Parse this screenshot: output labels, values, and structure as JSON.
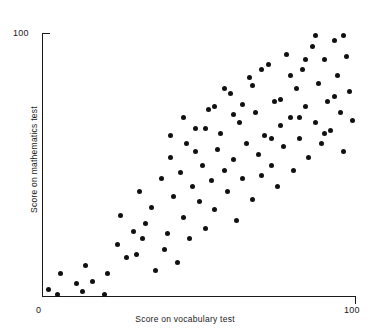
{
  "chart_data": {
    "type": "scatter",
    "title": "",
    "xlabel": "Score on vocabulary test",
    "ylabel": "Score on mathematics test",
    "xlim": [
      0,
      100
    ],
    "ylim": [
      0,
      100
    ],
    "xticks": [
      0,
      100
    ],
    "yticks": [
      100
    ],
    "xtick_labels": [
      "0",
      "100"
    ],
    "ytick_labels": [
      "100"
    ],
    "grid": false,
    "legend": null,
    "marker": "filled-circle",
    "marker_color": "#111111",
    "marker_size_px": 5,
    "axis_color": "#1a1a1a",
    "background_color": "#ffffff",
    "n_points": 100,
    "points": [
      [
        2,
        3
      ],
      [
        5,
        1
      ],
      [
        6,
        9
      ],
      [
        11,
        5
      ],
      [
        13,
        2
      ],
      [
        14,
        12
      ],
      [
        16,
        6
      ],
      [
        20,
        1
      ],
      [
        21,
        9
      ],
      [
        24,
        20
      ],
      [
        25,
        31
      ],
      [
        27,
        15
      ],
      [
        29,
        25
      ],
      [
        30,
        16
      ],
      [
        31,
        40
      ],
      [
        32,
        22
      ],
      [
        33,
        28
      ],
      [
        35,
        34
      ],
      [
        36,
        10
      ],
      [
        38,
        45
      ],
      [
        39,
        18
      ],
      [
        40,
        24
      ],
      [
        41,
        53
      ],
      [
        42,
        38
      ],
      [
        43,
        13
      ],
      [
        44,
        47
      ],
      [
        45,
        30
      ],
      [
        46,
        58
      ],
      [
        47,
        22
      ],
      [
        48,
        42
      ],
      [
        49,
        64
      ],
      [
        50,
        36
      ],
      [
        51,
        50
      ],
      [
        52,
        26
      ],
      [
        53,
        71
      ],
      [
        54,
        44
      ],
      [
        55,
        33
      ],
      [
        56,
        56
      ],
      [
        57,
        62
      ],
      [
        58,
        48
      ],
      [
        59,
        40
      ],
      [
        60,
        77
      ],
      [
        61,
        52
      ],
      [
        62,
        29
      ],
      [
        63,
        66
      ],
      [
        64,
        45
      ],
      [
        65,
        58
      ],
      [
        66,
        83
      ],
      [
        67,
        37
      ],
      [
        68,
        70
      ],
      [
        69,
        54
      ],
      [
        70,
        46
      ],
      [
        71,
        61
      ],
      [
        72,
        88
      ],
      [
        73,
        50
      ],
      [
        74,
        74
      ],
      [
        75,
        42
      ],
      [
        76,
        65
      ],
      [
        77,
        57
      ],
      [
        78,
        92
      ],
      [
        79,
        68
      ],
      [
        80,
        48
      ],
      [
        81,
        79
      ],
      [
        82,
        60
      ],
      [
        83,
        86
      ],
      [
        84,
        72
      ],
      [
        85,
        53
      ],
      [
        86,
        95
      ],
      [
        87,
        66
      ],
      [
        88,
        81
      ],
      [
        89,
        58
      ],
      [
        90,
        90
      ],
      [
        91,
        74
      ],
      [
        92,
        63
      ],
      [
        93,
        97
      ],
      [
        94,
        84
      ],
      [
        95,
        70
      ],
      [
        96,
        55
      ],
      [
        97,
        91
      ],
      [
        98,
        78
      ],
      [
        99,
        67
      ],
      [
        96,
        99
      ],
      [
        93,
        76
      ],
      [
        90,
        62
      ],
      [
        87,
        99
      ],
      [
        84,
        90
      ],
      [
        82,
        68
      ],
      [
        79,
        84
      ],
      [
        76,
        75
      ],
      [
        73,
        60
      ],
      [
        70,
        86
      ],
      [
        67,
        80
      ],
      [
        64,
        73
      ],
      [
        61,
        69
      ],
      [
        58,
        79
      ],
      [
        55,
        72
      ],
      [
        52,
        64
      ],
      [
        49,
        55
      ],
      [
        45,
        68
      ],
      [
        41,
        61
      ]
    ]
  }
}
